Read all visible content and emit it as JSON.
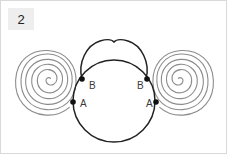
{
  "figure": {
    "panel_label": "2",
    "background_color": "#ffffff",
    "border_color": "#d9d9d9",
    "label_box_color": "#eeeeee"
  },
  "diagram": {
    "title": "",
    "stroke_color_main": "#222222",
    "stroke_color_spiral": "#8c8c8c",
    "point_color": "#111111",
    "points": [
      {
        "id": "b-left",
        "label": "B",
        "x": 81,
        "y": 78
      },
      {
        "id": "a-left",
        "label": "A",
        "x": 72,
        "y": 101
      },
      {
        "id": "b-right",
        "label": "B",
        "x": 146,
        "y": 78
      },
      {
        "id": "a-right",
        "label": "A",
        "x": 155,
        "y": 101
      }
    ],
    "shapes": [
      {
        "name": "central-circle",
        "type": "circle-outline",
        "cx": 113,
        "cy": 100,
        "r": 41
      },
      {
        "name": "top-lobed-arc",
        "type": "heart-arc",
        "notch_x": 113,
        "notch_y": 41
      },
      {
        "name": "left-spiral",
        "type": "spiral",
        "cx": 48,
        "cy": 79,
        "turns": 8
      },
      {
        "name": "right-spiral",
        "type": "spiral",
        "cx": 179,
        "cy": 79,
        "turns": 8
      }
    ]
  }
}
